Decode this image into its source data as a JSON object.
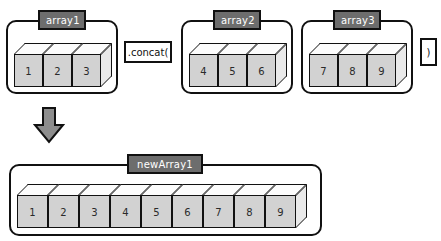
{
  "diagram": {
    "colors": {
      "plate_fill": "#6d6d6d",
      "plate_text": "#ffffff",
      "cube_front": "#d2d2d2",
      "cube_top": "#fcfcfc",
      "cube_side": "#e9e9e9",
      "outline": "#111111",
      "arrow_fill": "#8d8d8d",
      "background": "#ffffff"
    },
    "source_arrays": [
      {
        "label": "array1",
        "values": [
          "1",
          "2",
          "3"
        ]
      },
      {
        "label": "array2",
        "values": [
          "4",
          "5",
          "6"
        ]
      },
      {
        "label": "array3",
        "values": [
          "7",
          "8",
          "9"
        ]
      }
    ],
    "tokens": {
      "concat_call": ".concat(",
      "close_paren": ")"
    },
    "arrow": {
      "name": "result-arrow",
      "direction": "down"
    },
    "result_array": {
      "label": "newArray1",
      "values": [
        "1",
        "2",
        "3",
        "4",
        "5",
        "6",
        "7",
        "8",
        "9"
      ]
    }
  }
}
